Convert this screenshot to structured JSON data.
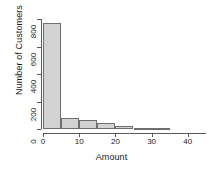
{
  "chart_data": {
    "type": "bar",
    "subtype": "histogram",
    "title": "",
    "xlabel": "Amount",
    "ylabel": "Number of Customers",
    "bin_width": 5,
    "bin_edges": [
      0,
      5,
      10,
      15,
      20,
      25,
      30,
      35
    ],
    "categories": [
      "0-5",
      "5-10",
      "10-15",
      "15-20",
      "20-25",
      "25-30",
      "30-35"
    ],
    "values": [
      770,
      80,
      63,
      42,
      22,
      9,
      4
    ],
    "x": [
      2.5,
      7.5,
      12.5,
      17.5,
      22.5,
      27.5,
      32.5
    ],
    "xlim": [
      0,
      45
    ],
    "ylim": [
      0,
      800
    ],
    "xticks": [
      0,
      10,
      20,
      30,
      40
    ],
    "xtick_labels": [
      "0",
      "10",
      "20",
      "30",
      "40"
    ],
    "yticks": [
      0,
      200,
      400,
      600,
      800
    ],
    "ytick_labels": [
      "0",
      "200",
      "400",
      "600",
      "800"
    ],
    "grid": false,
    "legend": false,
    "bar_fill_color": "#d2d2d2",
    "bar_border_color": "#6e6e6e",
    "axis_color": "#5a5a5a",
    "text_color": "#1a1a1a",
    "background_color": "#ffffff"
  }
}
